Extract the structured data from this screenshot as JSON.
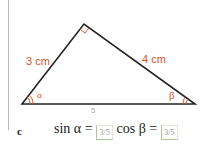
{
  "figure": {
    "side_left_label": "3 cm",
    "side_right_label": "4 cm",
    "angle_left_label": "α",
    "angle_right_label": "β",
    "hypotenuse_annotation": "5"
  },
  "question": {
    "letter": "c",
    "sin_label": "sin α =",
    "sin_answer": "3/5",
    "cos_label": "cos β =",
    "cos_answer": "3/5"
  },
  "colors": {
    "accent": "#d9532c",
    "answer_border": "#a9c99a"
  }
}
